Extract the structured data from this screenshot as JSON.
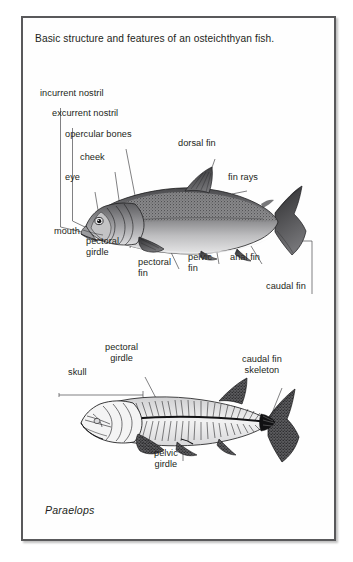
{
  "plate": {
    "caption": "Basic structure and features of an osteichthyan fish.",
    "species": "Paraelops",
    "border_color": "#59595b",
    "background_color": "#fefefe",
    "text_color": "#231f20"
  },
  "figures": [
    {
      "id": "osteichthyan-fish-external",
      "name": "labelled external anatomy of a bony fish",
      "labels": [
        {
          "key": "incurrent_nostril",
          "text": "incurrent nostril",
          "x": 38,
          "y": 86
        },
        {
          "key": "excurrent_nostril",
          "text": "excurrent nostril",
          "x": 50,
          "y": 106
        },
        {
          "key": "opercular_bones",
          "text": "opercular bones",
          "x": 63,
          "y": 127
        },
        {
          "key": "cheek",
          "text": "cheek",
          "x": 78,
          "y": 150
        },
        {
          "key": "eye",
          "text": "eye",
          "x": 63,
          "y": 170
        },
        {
          "key": "mouth",
          "text": "mouth",
          "x": 52,
          "y": 224
        },
        {
          "key": "pectoral_girdle",
          "text": "pectoral\ngirdle",
          "x": 84,
          "y": 234
        },
        {
          "key": "pectoral_fin",
          "text": "pectoral\nfin",
          "x": 136,
          "y": 255
        },
        {
          "key": "pelvic_fin",
          "text": "pelvic\nfin",
          "x": 186,
          "y": 250
        },
        {
          "key": "anal_fin",
          "text": "anal fin",
          "x": 228,
          "y": 250
        },
        {
          "key": "dorsal_fin",
          "text": "dorsal fin",
          "x": 176,
          "y": 136
        },
        {
          "key": "fin_rays",
          "text": "fin rays",
          "x": 226,
          "y": 170
        },
        {
          "key": "caudal_fin",
          "text": "caudal fin",
          "x": 264,
          "y": 279
        }
      ]
    },
    {
      "id": "paraelops-skeleton",
      "name": "labelled skeleton of the fossil fish Paraelops",
      "labels": [
        {
          "key": "skull",
          "text": "skull",
          "x": 66,
          "y": 365
        },
        {
          "key": "pectoral_girdle_2",
          "text": "pectoral\ngirdle",
          "x": 103,
          "y": 340
        },
        {
          "key": "caudal_fin_skeleton",
          "text": "caudal fin\nskeleton",
          "x": 240,
          "y": 352
        },
        {
          "key": "pelvic_girdle",
          "text": "pelvic\ngirdle",
          "x": 152,
          "y": 446
        }
      ]
    }
  ]
}
